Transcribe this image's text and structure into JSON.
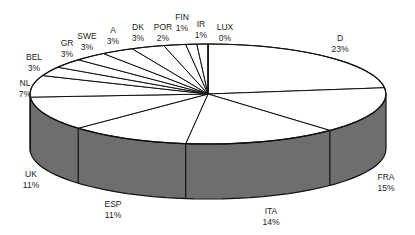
{
  "chart_data": {
    "type": "pie",
    "style": "3d-pie",
    "title": "",
    "start_angle_deg": 0,
    "direction": "clockwise",
    "categories": [
      "D",
      "FRA",
      "ITA",
      "ESP",
      "UK",
      "NL",
      "BEL",
      "GR",
      "SWE",
      "A",
      "DK",
      "POR",
      "FIN",
      "IR",
      "LUX"
    ],
    "values": [
      23,
      15,
      14,
      11,
      11,
      7,
      3,
      3,
      3,
      3,
      3,
      2,
      1,
      1,
      0
    ],
    "value_labels": [
      "23%",
      "15%",
      "14%",
      "11%",
      "11%",
      "7%",
      "3%",
      "3%",
      "3%",
      "3%",
      "3%",
      "2%",
      "1%",
      "1%",
      "0%"
    ],
    "legend": "none",
    "colors": {
      "top": "#ffffff",
      "side": "#6e6e6e",
      "edge": "#111111"
    }
  },
  "labels": [
    {
      "name": "D",
      "pct": "23%",
      "x": 340,
      "y": 33
    },
    {
      "name": "FRA",
      "pct": "15%",
      "x": 386,
      "y": 172
    },
    {
      "name": "ITA",
      "pct": "14%",
      "x": 271,
      "y": 206
    },
    {
      "name": "ESP",
      "pct": "11%",
      "x": 113,
      "y": 199
    },
    {
      "name": "UK",
      "pct": "11%",
      "x": 31,
      "y": 169
    },
    {
      "name": "NL",
      "pct": "7%",
      "x": 25,
      "y": 78
    },
    {
      "name": "BEL",
      "pct": "3%",
      "x": 34,
      "y": 52
    },
    {
      "name": "GR",
      "pct": "3%",
      "x": 67,
      "y": 38
    },
    {
      "name": "SWE",
      "pct": "3%",
      "x": 87,
      "y": 31
    },
    {
      "name": "A",
      "pct": "3%",
      "x": 113,
      "y": 25
    },
    {
      "name": "DK",
      "pct": "3%",
      "x": 138,
      "y": 22
    },
    {
      "name": "POR",
      "pct": "2%",
      "x": 163,
      "y": 22
    },
    {
      "name": "FIN",
      "pct": "1%",
      "x": 182,
      "y": 12
    },
    {
      "name": "IR",
      "pct": "1%",
      "x": 201,
      "y": 19
    },
    {
      "name": "LUX",
      "pct": "0%",
      "x": 225,
      "y": 22
    }
  ]
}
